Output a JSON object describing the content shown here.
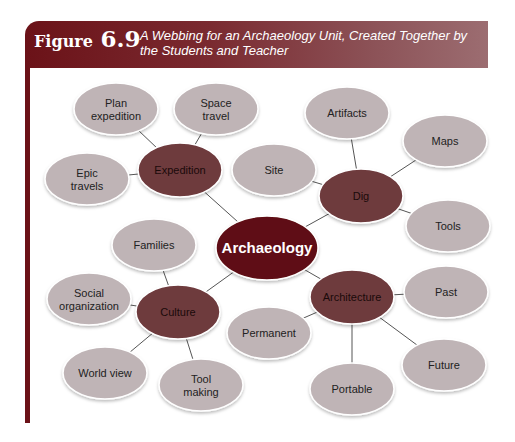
{
  "figure": {
    "label_word": "Figure",
    "label_number": "6.9",
    "caption": "A Webbing for an Archaeology Unit, Created Together by the Students and Teacher"
  },
  "colors": {
    "header_dark": "#6b1218",
    "header_light": "#9c6d71",
    "center_fill": "#5e0f12",
    "sub_fill": "#6e3a3e",
    "leaf_fill": "#bfb4b6",
    "edge": "#555555"
  },
  "web": {
    "center": {
      "id": "archaeology",
      "label": "Archaeology",
      "cx": 267,
      "cy": 248,
      "rx": 51,
      "ry": 32
    },
    "subtopics": [
      {
        "id": "expedition",
        "label": "Expedition",
        "cx": 180,
        "cy": 170,
        "rx": 42,
        "ry": 27
      },
      {
        "id": "dig",
        "label": "Dig",
        "cx": 361,
        "cy": 196,
        "rx": 42,
        "ry": 27
      },
      {
        "id": "culture",
        "label": "Culture",
        "cx": 178,
        "cy": 312,
        "rx": 42,
        "ry": 27
      },
      {
        "id": "architecture",
        "label": "Architecture",
        "cx": 352,
        "cy": 297,
        "rx": 42,
        "ry": 27
      }
    ],
    "leaves": [
      {
        "id": "plan-expedition",
        "parent": "expedition",
        "lines": [
          "Plan",
          "expedition"
        ],
        "cx": 116,
        "cy": 109
      },
      {
        "id": "space-travel",
        "parent": "expedition",
        "lines": [
          "Space",
          "travel"
        ],
        "cx": 216,
        "cy": 109
      },
      {
        "id": "epic-travels",
        "parent": "expedition",
        "lines": [
          "Epic",
          "travels"
        ],
        "cx": 87,
        "cy": 179
      },
      {
        "id": "artifacts",
        "parent": "dig",
        "lines": [
          "Artifacts"
        ],
        "cx": 347,
        "cy": 113
      },
      {
        "id": "maps",
        "parent": "dig",
        "lines": [
          "Maps"
        ],
        "cx": 445,
        "cy": 141
      },
      {
        "id": "site",
        "parent": "dig",
        "lines": [
          "Site"
        ],
        "cx": 274,
        "cy": 170
      },
      {
        "id": "tools",
        "parent": "dig",
        "lines": [
          "Tools"
        ],
        "cx": 448,
        "cy": 226
      },
      {
        "id": "families",
        "parent": "culture",
        "lines": [
          "Families"
        ],
        "cx": 154,
        "cy": 245
      },
      {
        "id": "social-organization",
        "parent": "culture",
        "lines": [
          "Social",
          "organization"
        ],
        "cx": 89,
        "cy": 299
      },
      {
        "id": "world-view",
        "parent": "culture",
        "lines": [
          "World view"
        ],
        "cx": 105,
        "cy": 373
      },
      {
        "id": "tool-making",
        "parent": "culture",
        "lines": [
          "Tool",
          "making"
        ],
        "cx": 201,
        "cy": 385
      },
      {
        "id": "past",
        "parent": "architecture",
        "lines": [
          "Past"
        ],
        "cx": 446,
        "cy": 292
      },
      {
        "id": "permanent",
        "parent": "architecture",
        "lines": [
          "Permanent"
        ],
        "cx": 269,
        "cy": 333
      },
      {
        "id": "future",
        "parent": "architecture",
        "lines": [
          "Future"
        ],
        "cx": 444,
        "cy": 365
      },
      {
        "id": "portable",
        "parent": "architecture",
        "lines": [
          "Portable"
        ],
        "cx": 352,
        "cy": 389
      }
    ],
    "leaf_rx": 42,
    "leaf_ry": 26
  }
}
